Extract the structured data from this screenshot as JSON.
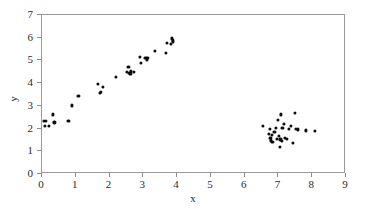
{
  "chart_data": {
    "type": "scatter",
    "title": "",
    "xlabel": "x",
    "ylabel": "y",
    "xlim": [
      0,
      9
    ],
    "ylim": [
      0,
      7
    ],
    "xticks": [
      0,
      1,
      2,
      3,
      4,
      5,
      6,
      7,
      8,
      9
    ],
    "yticks": [
      0,
      1,
      2,
      3,
      4,
      5,
      6,
      7
    ],
    "grid": false,
    "legend": null,
    "marker_color": "#0d0d0d",
    "marker_size": 3.2,
    "frame_color": "#9a9a9a",
    "series": [
      {
        "name": "cluster-1-linear",
        "points": [
          [
            0.05,
            2.35
          ],
          [
            0.08,
            2.1
          ],
          [
            0.12,
            2.32
          ],
          [
            0.2,
            2.12
          ],
          [
            0.32,
            2.62
          ],
          [
            0.37,
            2.27
          ],
          [
            0.78,
            2.33
          ],
          [
            0.88,
            3.02
          ],
          [
            1.08,
            3.43
          ],
          [
            1.66,
            3.95
          ],
          [
            1.72,
            3.57
          ],
          [
            1.75,
            3.62
          ],
          [
            1.8,
            3.82
          ],
          [
            2.18,
            4.29
          ],
          [
            2.52,
            4.48
          ],
          [
            2.56,
            4.72
          ],
          [
            2.58,
            4.45
          ],
          [
            2.62,
            4.42
          ],
          [
            2.64,
            4.52
          ],
          [
            2.72,
            4.48
          ],
          [
            2.9,
            5.16
          ],
          [
            2.92,
            4.9
          ],
          [
            3.06,
            5.1
          ],
          [
            3.1,
            5.02
          ],
          [
            3.12,
            5.12
          ],
          [
            3.35,
            5.42
          ],
          [
            3.66,
            5.33
          ],
          [
            3.7,
            5.78
          ],
          [
            3.82,
            5.72
          ],
          [
            3.85,
            5.97
          ],
          [
            3.87,
            5.88
          ],
          [
            3.88,
            5.8
          ]
        ]
      },
      {
        "name": "cluster-2-blob",
        "points": [
          [
            6.55,
            2.13
          ],
          [
            6.72,
            1.78
          ],
          [
            6.74,
            1.98
          ],
          [
            6.76,
            1.6
          ],
          [
            6.78,
            1.48
          ],
          [
            6.8,
            1.72
          ],
          [
            6.82,
            1.43
          ],
          [
            6.88,
            1.85
          ],
          [
            6.92,
            2.02
          ],
          [
            6.96,
            1.55
          ],
          [
            6.98,
            2.38
          ],
          [
            7.02,
            1.66
          ],
          [
            7.05,
            1.2
          ],
          [
            7.06,
            1.52
          ],
          [
            7.08,
            2.62
          ],
          [
            7.1,
            1.44
          ],
          [
            7.12,
            2.02
          ],
          [
            7.16,
            2.22
          ],
          [
            7.2,
            1.58
          ],
          [
            7.24,
            1.54
          ],
          [
            7.32,
            1.98
          ],
          [
            7.38,
            2.1
          ],
          [
            7.44,
            1.38
          ],
          [
            7.48,
            2.7
          ],
          [
            7.52,
            2.0
          ],
          [
            7.58,
            1.96
          ],
          [
            7.82,
            1.92
          ],
          [
            8.08,
            1.88
          ]
        ]
      }
    ]
  }
}
